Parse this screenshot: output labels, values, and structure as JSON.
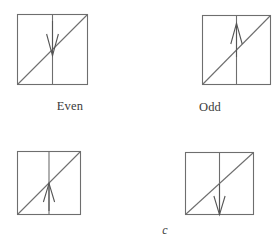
{
  "figure": {
    "background_color": "#ffffff",
    "line_color": "#6e6e6e",
    "arrow_color": "#555555",
    "panels": [
      {
        "id": "panel-even",
        "caption": "Even",
        "caption_style": "roman",
        "square": {
          "x": 17,
          "y": 14,
          "size": 71
        },
        "diagonal": "bottom-left-to-top-right",
        "midline": "vertical-center",
        "arrow": {
          "name": "down-arrow",
          "direction": "down",
          "position": "upper-half",
          "tail_y": 22,
          "tip_y": 55,
          "x": 52
        }
      },
      {
        "id": "panel-odd",
        "caption": "Odd",
        "caption_style": "roman",
        "square": {
          "x": 202,
          "y": 15,
          "size": 69
        },
        "diagonal": "bottom-left-to-top-right",
        "midline": "vertical-center",
        "arrow": {
          "name": "up-arrow",
          "direction": "up",
          "position": "upper-half",
          "tail_y": 57,
          "tip_y": 24,
          "x": 237
        }
      },
      {
        "id": "panel-c-left",
        "caption": "c",
        "caption_style": "italic",
        "square": {
          "x": 17,
          "y": 151,
          "size": 63
        },
        "diagonal": "bottom-left-to-top-right",
        "midline": "vertical-center",
        "arrow": {
          "name": "up-arrow",
          "direction": "up",
          "position": "lower-half",
          "tail_y": 211,
          "tip_y": 184,
          "x": 49
        }
      },
      {
        "id": "panel-c-right",
        "caption": "c",
        "caption_style": "italic",
        "square": {
          "x": 185,
          "y": 152,
          "size": 68
        },
        "diagonal": "bottom-left-to-top-right",
        "midline": "vertical-center",
        "arrow": {
          "name": "down-arrow",
          "direction": "down",
          "position": "lower-half",
          "tail_y": 186,
          "tip_y": 215,
          "x": 219
        }
      }
    ]
  }
}
